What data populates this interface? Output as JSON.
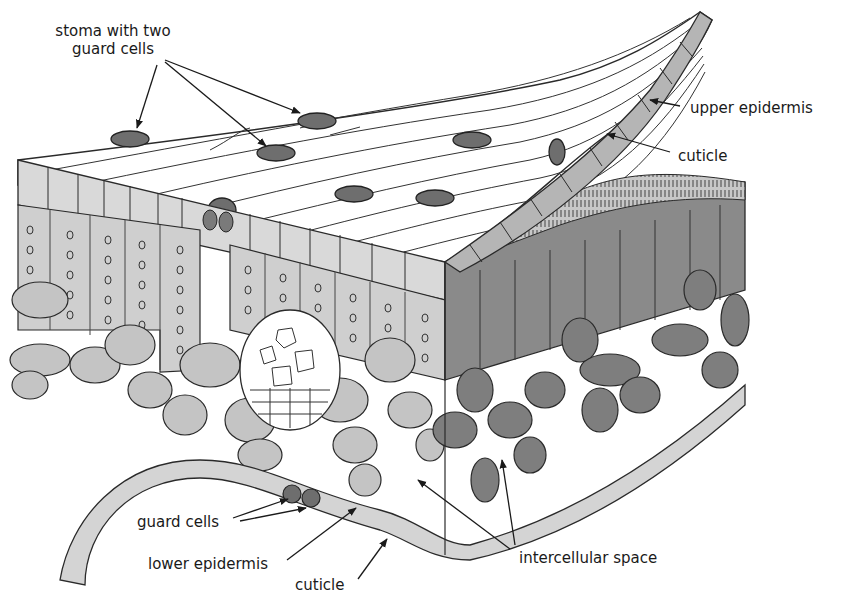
{
  "diagram": {
    "colors": {
      "background": "#ffffff",
      "outline": "#2a2a2a",
      "surface": "#ffffff",
      "upper_epidermis": "#d9d9d9",
      "palisade_light": "#cfcfcf",
      "spongy_light": "#c4c4c4",
      "palisade_dark": "#8a8a8a",
      "spongy_dark": "#7e7e7e",
      "epidermis_right": "#b5b5b5",
      "guard_cell": "#6e6e6e",
      "vein": "#ffffff",
      "chloroplast": "#ffffff"
    },
    "labels": [
      {
        "id": "stoma-with-two-guard-cells",
        "lines": [
          "stoma with two",
          "guard cells"
        ],
        "x": 48,
        "y": 22,
        "align": "center",
        "width": 130
      },
      {
        "id": "upper-epidermis",
        "lines": [
          "upper epidermis"
        ],
        "x": 690,
        "y": 99,
        "align": "left"
      },
      {
        "id": "cuticle-upper",
        "lines": [
          "cuticle"
        ],
        "x": 678,
        "y": 147,
        "align": "left"
      },
      {
        "id": "guard-cells",
        "lines": [
          "guard cells"
        ],
        "x": 137,
        "y": 513,
        "align": "left"
      },
      {
        "id": "lower-epidermis",
        "lines": [
          "lower epidermis"
        ],
        "x": 148,
        "y": 555,
        "align": "left"
      },
      {
        "id": "cuticle-lower",
        "lines": [
          "cuticle"
        ],
        "x": 295,
        "y": 576,
        "align": "left"
      },
      {
        "id": "intercellular-space",
        "lines": [
          "intercellular space"
        ],
        "x": 519,
        "y": 549,
        "align": "left"
      }
    ],
    "arrows": [
      {
        "for": "stoma-with-two-guard-cells",
        "x1": 157,
        "y1": 65,
        "x2": 137,
        "y2": 128
      },
      {
        "for": "stoma-with-two-guard-cells",
        "x1": 165,
        "y1": 62,
        "x2": 266,
        "y2": 146
      },
      {
        "for": "stoma-with-two-guard-cells",
        "x1": 165,
        "y1": 60,
        "x2": 300,
        "y2": 113
      },
      {
        "for": "upper-epidermis",
        "x1": 680,
        "y1": 106,
        "x2": 650,
        "y2": 100
      },
      {
        "for": "cuticle-upper",
        "x1": 670,
        "y1": 152,
        "x2": 607,
        "y2": 134
      },
      {
        "for": "guard-cells",
        "x1": 233,
        "y1": 518,
        "x2": 288,
        "y2": 499
      },
      {
        "for": "guard-cells",
        "x1": 240,
        "y1": 521,
        "x2": 306,
        "y2": 508
      },
      {
        "for": "lower-epidermis",
        "x1": 287,
        "y1": 560,
        "x2": 356,
        "y2": 508
      },
      {
        "for": "cuticle-lower",
        "x1": 358,
        "y1": 579,
        "x2": 387,
        "y2": 539
      },
      {
        "for": "intercellular-space",
        "x1": 510,
        "y1": 549,
        "x2": 418,
        "y2": 480
      },
      {
        "for": "intercellular-space",
        "x1": 515,
        "y1": 545,
        "x2": 502,
        "y2": 460
      }
    ]
  }
}
